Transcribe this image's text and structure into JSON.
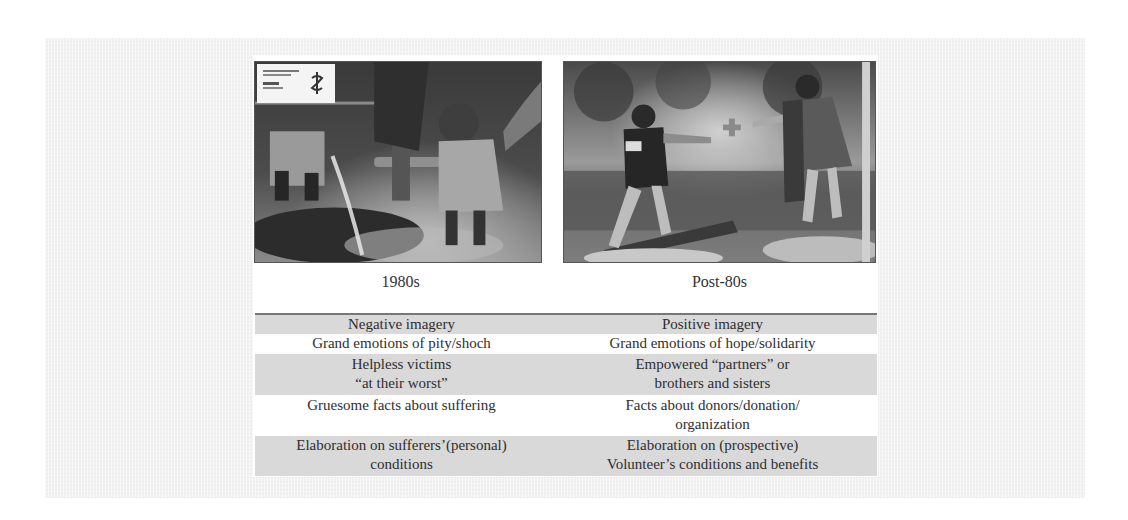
{
  "figure": {
    "photos": [
      {
        "id": "left",
        "label": "1980s",
        "description": "Black-and-white photo of a child standing near water, with an Amnesty International logo box in the top-left corner",
        "logo_icon": "amnesty-candle-icon"
      },
      {
        "id": "right",
        "label": "Post-80s",
        "description": "Black-and-white photo of a Red Cross volunteer reaching out to help a woman cross a log",
        "logo_icon": "red-cross-icon"
      }
    ],
    "table": {
      "rows": [
        {
          "shade": "gray",
          "left": "Negative imagery",
          "right": "Positive imagery"
        },
        {
          "shade": "white",
          "left": "Grand emotions of pity/shoch",
          "right": "Grand emotions of hope/solidarity"
        },
        {
          "shade": "gray",
          "left": "Helpless victims\n“at their worst”",
          "right": "Empowered “partners” or\nbrothers and sisters"
        },
        {
          "shade": "white",
          "left": "Gruesome facts about suffering",
          "right": "Facts about donors/donation/\norganization"
        },
        {
          "shade": "gray",
          "left": "Elaboration on sufferers’(personal)\nconditions",
          "right": "Elaboration on (prospective)\nVolunteer’s conditions and benefits"
        }
      ]
    },
    "colors": {
      "gray_row": "#d9d9d9",
      "text": "#2e2e2e",
      "border": "#777777"
    }
  }
}
